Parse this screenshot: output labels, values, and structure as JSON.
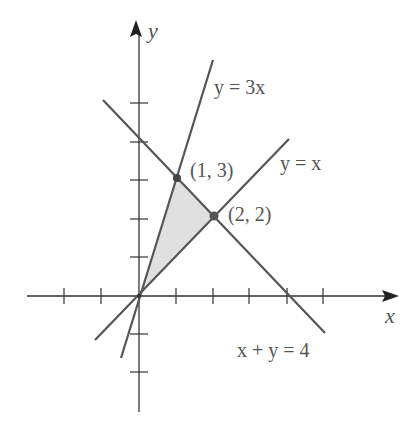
{
  "diagram": {
    "type": "linear-inequality-region",
    "axes": {
      "x_label": "x",
      "y_label": "y",
      "x_ticks": [
        -2,
        -1,
        1,
        2,
        3,
        4,
        5
      ],
      "y_ticks": [
        -2,
        -1,
        1,
        2,
        3,
        4,
        5
      ]
    },
    "lines": [
      {
        "equation": "y = 3x",
        "label": "y = 3x"
      },
      {
        "equation": "y = x",
        "label": "y = x"
      },
      {
        "equation": "x + y = 4",
        "label": "x + y = 4"
      }
    ],
    "points": [
      {
        "label": "(1, 3)",
        "x": 1,
        "y": 3
      },
      {
        "label": "(2, 2)",
        "x": 2,
        "y": 2
      }
    ],
    "shaded_region": {
      "vertices": [
        [
          0,
          0
        ],
        [
          1,
          3
        ],
        [
          2,
          2
        ]
      ],
      "fill": "#e0e0e0"
    },
    "colors": {
      "axis": "#333333",
      "line": "#555555",
      "text": "#555555",
      "point": "#444444"
    }
  }
}
